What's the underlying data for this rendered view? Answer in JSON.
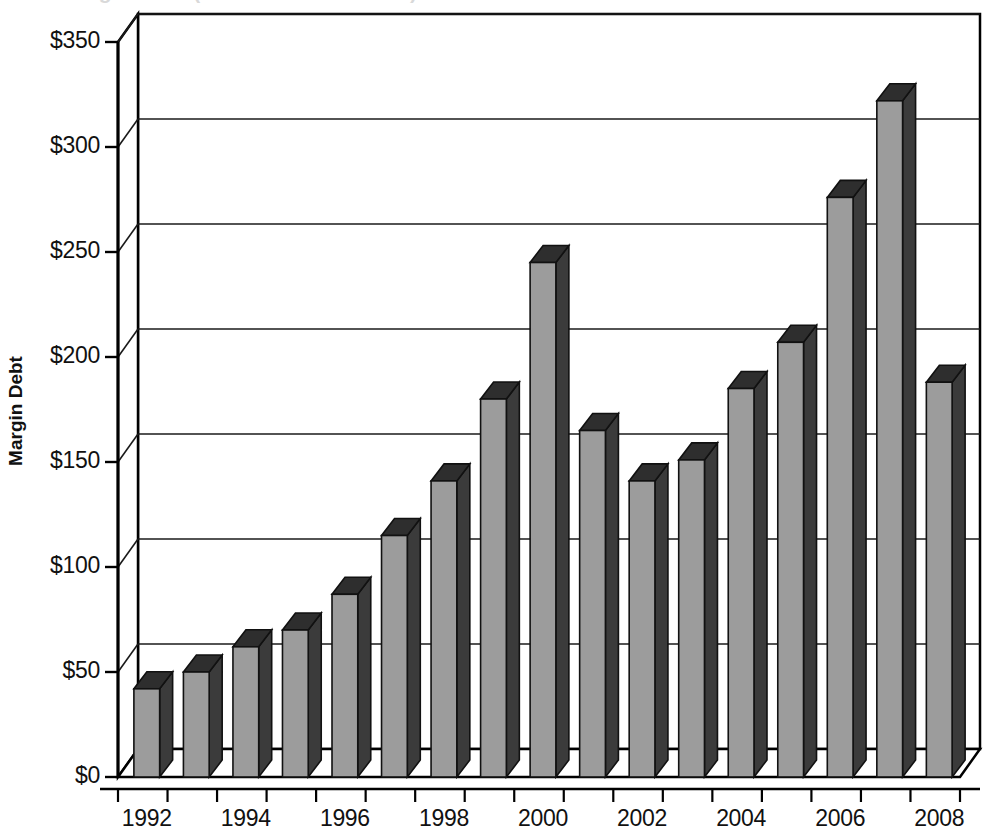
{
  "figure": {
    "background_color": "#ffffff",
    "cut_off_title": "Margin Debt (in billions of dollars)"
  },
  "axis_style": {
    "bar_front_color": "#9c9c9c",
    "bar_side_color": "#3b3b3b",
    "bar_top_color": "#2e2e2e",
    "bar_outline_color": "#111111",
    "wall_color": "#ffffff",
    "gridline_color": "#1a1a1a",
    "axis_line_color": "#000000",
    "text_color": "#111111"
  },
  "chart_data": {
    "type": "bar",
    "title": "",
    "xlabel": "",
    "ylabel": "Margin Debt",
    "ylim": [
      0,
      350
    ],
    "ytick_labels": [
      "$0",
      "$50",
      "$100",
      "$150",
      "$200",
      "$250",
      "$300",
      "$350"
    ],
    "ytick_values": [
      0,
      50,
      100,
      150,
      200,
      250,
      300,
      350
    ],
    "grid": true,
    "legend": "none",
    "projection": "3d",
    "categories": [
      "1992",
      "1993",
      "1994",
      "1995",
      "1996",
      "1997",
      "1998",
      "1999",
      "2000",
      "2001",
      "2002",
      "2003",
      "2004",
      "2005",
      "2006",
      "2007",
      "2008"
    ],
    "xtick_labels_shown": [
      "1992",
      "1994",
      "1996",
      "1998",
      "2000",
      "2002",
      "2004",
      "2006",
      "2008"
    ],
    "values": [
      42,
      50,
      62,
      70,
      87,
      115,
      141,
      180,
      245,
      165,
      141,
      151,
      185,
      207,
      276,
      322,
      188
    ],
    "series": [
      {
        "name": "Margin Debt",
        "values": [
          42,
          50,
          62,
          70,
          87,
          115,
          141,
          180,
          245,
          165,
          141,
          151,
          185,
          207,
          276,
          322,
          188
        ]
      }
    ]
  }
}
